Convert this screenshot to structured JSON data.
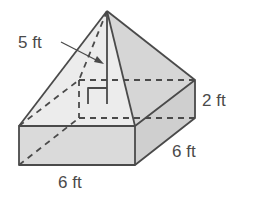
{
  "figure": {
    "labels": {
      "slant_or_height": "5 ft",
      "prism_height": "2 ft",
      "depth": "6 ft",
      "width": "6 ft"
    },
    "colors": {
      "stroke": "#4a4a4a",
      "face_front_pyramid": "#ececec",
      "face_right_pyramid": "#d6d6d6",
      "prism_front": "#dadada",
      "prism_right": "#cfcfcf",
      "prism_top": "#e6e6e6"
    }
  }
}
